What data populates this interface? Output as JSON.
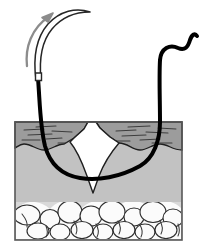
{
  "figure": {
    "alt_text": "Cross-sectional medical illustration of skin showing a curved surgical needle being drawn upward out of the tissue while the black suture thread passes beneath the base of a V-shaped wound",
    "width": 202,
    "height": 250,
    "background_color": "#ffffff"
  },
  "colors": {
    "outline": "#1a1a1a",
    "suture_thread": "#000000",
    "needle_fill": "#ffffff",
    "needle_outline": "#2b2b2b",
    "arrow": "#8c8c8c",
    "epidermis": "#9a9a9a",
    "dermis": "#c2c2c2",
    "subcutaneous_fat_bg": "#d2d2d2",
    "fat_lobule": "#fbfbfb",
    "wound_gap": "#ffffff",
    "box_border": "#555555"
  },
  "labels": {
    "needle": "curved surgical needle",
    "arrow": "needle withdrawal direction",
    "suture": "suture thread",
    "epidermis": "epidermis",
    "dermis": "dermis",
    "subcutaneous": "subcutaneous fat",
    "wound": "wound defect",
    "entry_point": "needle entry point",
    "exit_point": "needle exit point",
    "thread_tail": "free suture tail"
  },
  "geometry": {
    "tissue_box": {
      "x": 15,
      "y": 122,
      "width": 167,
      "height": 118
    },
    "epidermis_band_bottom": 148,
    "fat_layer_top": 202,
    "wound_apex": {
      "x": 92,
      "y": 193
    },
    "needle_tip": {
      "x": 90,
      "y": 12
    },
    "needle_shaft_end": {
      "x": 38,
      "y": 78
    },
    "thread_tail_end": {
      "x": 196,
      "y": 38
    },
    "arrow_head": {
      "x": 48,
      "y": 14
    }
  },
  "arrow": {
    "icon": "curved-arrow-icon",
    "direction": "up-and-to-the-right",
    "stroke_width": 2.4
  },
  "needle": {
    "icon": "curved-needle-icon",
    "body_width": 4.2,
    "curvature": "three-eighths circle"
  },
  "suture": {
    "icon": "suture-thread-icon",
    "stroke_width": 4.0,
    "path_description": "enters left of wound, passes under the wound apex, exits right of wound, tail loops up and right"
  },
  "fat_lobules": [
    {
      "cx": 27,
      "cy": 215,
      "rx": 13,
      "ry": 10
    },
    {
      "cx": 50,
      "cy": 219,
      "rx": 10,
      "ry": 9.5
    },
    {
      "cx": 70,
      "cy": 212,
      "rx": 12,
      "ry": 11
    },
    {
      "cx": 91,
      "cy": 216,
      "rx": 11,
      "ry": 10
    },
    {
      "cx": 112,
      "cy": 212,
      "rx": 13,
      "ry": 11
    },
    {
      "cx": 134,
      "cy": 217,
      "rx": 10,
      "ry": 9
    },
    {
      "cx": 153,
      "cy": 212,
      "rx": 13,
      "ry": 10.5
    },
    {
      "cx": 173,
      "cy": 218,
      "rx": 10,
      "ry": 9
    },
    {
      "cx": 38,
      "cy": 231,
      "rx": 11,
      "ry": 8
    },
    {
      "cx": 60,
      "cy": 232,
      "rx": 10,
      "ry": 8
    },
    {
      "cx": 82,
      "cy": 230,
      "rx": 11,
      "ry": 8.5
    },
    {
      "cx": 103,
      "cy": 232,
      "rx": 10,
      "ry": 8
    },
    {
      "cx": 124,
      "cy": 230,
      "rx": 11,
      "ry": 8.5
    },
    {
      "cx": 145,
      "cy": 232,
      "rx": 10,
      "ry": 8
    },
    {
      "cx": 166,
      "cy": 230,
      "rx": 11,
      "ry": 8.5
    }
  ],
  "epidermis_texture_lines": [
    {
      "x1": 24,
      "y1": 130,
      "x2": 44,
      "y2": 129
    },
    {
      "x1": 28,
      "y1": 135,
      "x2": 52,
      "y2": 134
    },
    {
      "x1": 22,
      "y1": 140,
      "x2": 40,
      "y2": 140
    },
    {
      "x1": 46,
      "y1": 139,
      "x2": 62,
      "y2": 138
    },
    {
      "x1": 52,
      "y1": 131,
      "x2": 72,
      "y2": 132
    },
    {
      "x1": 58,
      "y1": 143,
      "x2": 74,
      "y2": 143
    },
    {
      "x1": 36,
      "y1": 127,
      "x2": 56,
      "y2": 126
    },
    {
      "x1": 116,
      "y1": 131,
      "x2": 136,
      "y2": 130
    },
    {
      "x1": 122,
      "y1": 136,
      "x2": 146,
      "y2": 135
    },
    {
      "x1": 112,
      "y1": 141,
      "x2": 130,
      "y2": 141
    },
    {
      "x1": 140,
      "y1": 140,
      "x2": 160,
      "y2": 139
    },
    {
      "x1": 146,
      "y1": 132,
      "x2": 168,
      "y2": 133
    },
    {
      "x1": 152,
      "y1": 143,
      "x2": 172,
      "y2": 143
    },
    {
      "x1": 128,
      "y1": 127,
      "x2": 150,
      "y2": 126
    },
    {
      "x1": 158,
      "y1": 128,
      "x2": 176,
      "y2": 129
    }
  ]
}
